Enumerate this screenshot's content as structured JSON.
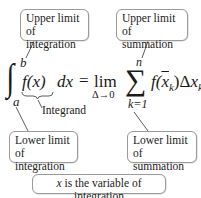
{
  "callouts": {
    "upper_integration": [
      "Upper limit",
      "of integration"
    ],
    "upper_summation": [
      "Upper limit",
      "of summation"
    ],
    "lower_integration": [
      "Lower limit",
      "of integration"
    ],
    "lower_summation": [
      "Lower limit",
      "of summation"
    ],
    "integrand": "Integrand",
    "variable_note_var": "x",
    "variable_note_rest": " is the variable of integration"
  },
  "formula": {
    "integral_sign": "∫",
    "upper_limit": "b",
    "lower_limit": "a",
    "integrand": "f(x)",
    "differential": "dx",
    "equals": "=",
    "lim": "lim",
    "lim_sub": "Δ→0",
    "sigma": "∑",
    "sum_upper": "n",
    "sum_lower": "k=1",
    "summand_f": "f(",
    "summand_xbar": "x",
    "summand_k1": "k",
    "summand_close": ")Δ",
    "summand_x": "x",
    "summand_k2": "k"
  }
}
